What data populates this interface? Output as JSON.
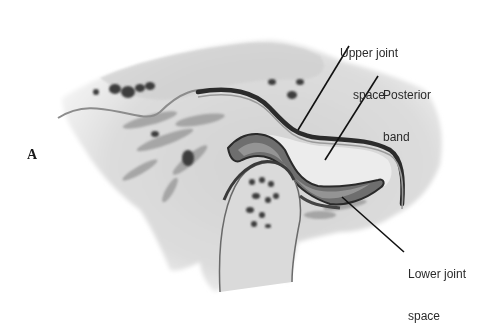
{
  "figure": {
    "panel_letter": "A",
    "labels": {
      "upper_joint_space": {
        "line1": "Upper joint",
        "line2": "space"
      },
      "posterior_band": {
        "line1": "Posterior",
        "line2": "band"
      },
      "lower_joint_space": {
        "line1": "Lower joint",
        "line2": "space"
      }
    },
    "colors": {
      "background": "#ffffff",
      "tissue_light": "#e6e6e6",
      "tissue_mid": "#c4c4c4",
      "tissue_dark": "#6a6a6a",
      "outline": "#2b2b2b",
      "label_text": "#2a2a2a"
    }
  }
}
